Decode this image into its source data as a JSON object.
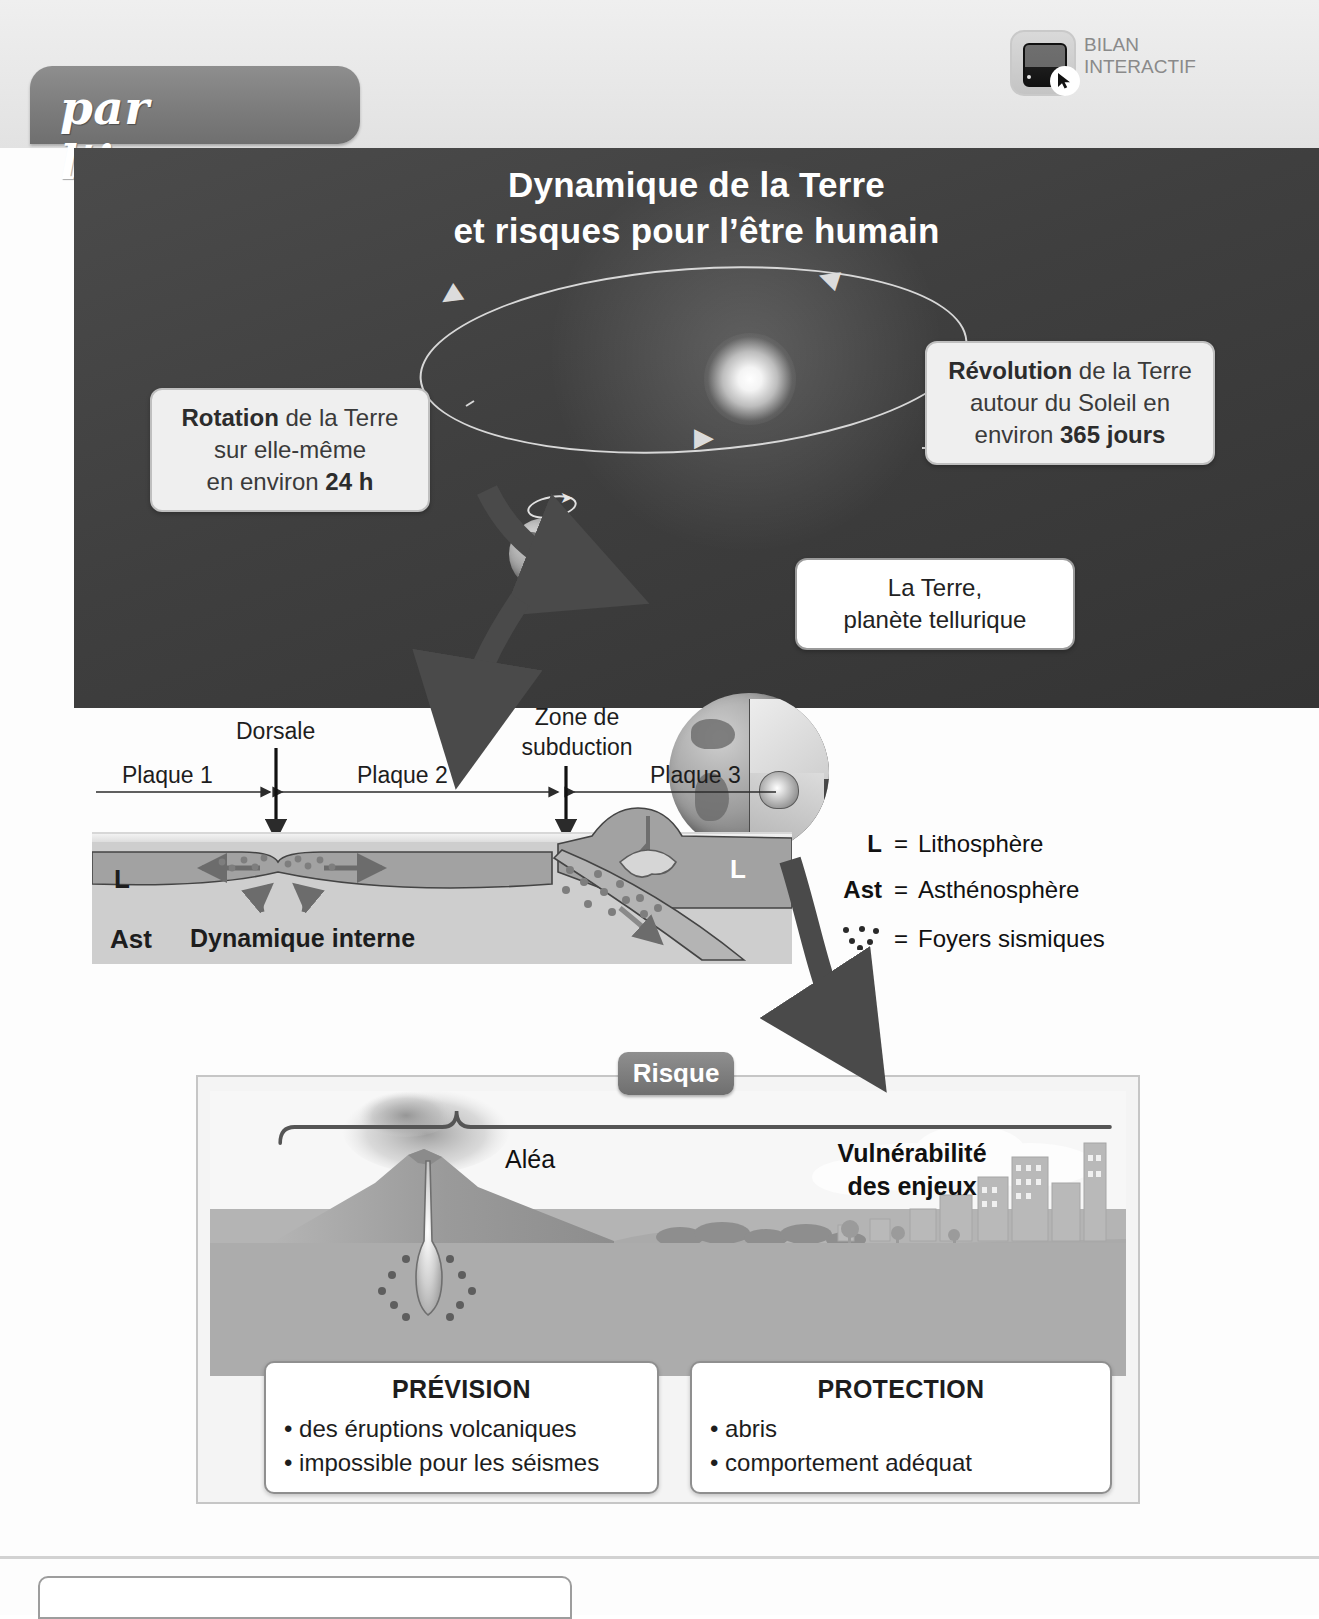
{
  "tab": {
    "label": "par l’image"
  },
  "badge": {
    "icon": "tablet-cursor-icon",
    "line1": "BILAN",
    "line2": "INTERACTIF"
  },
  "hero": {
    "title_line1": "Dynamique de la Terre",
    "title_line2": "et risques pour l’être humain",
    "sun": "sun-glow",
    "earth": "earth-globe",
    "orbit": "orbit-ellipse"
  },
  "callouts": {
    "rotation": {
      "bold1": "Rotation",
      "rest1": " de la Terre",
      "line2": "sur elle-même",
      "line3_pre": "en environ ",
      "line3_bold": "24 h"
    },
    "revolution": {
      "bold1": "Révolution",
      "rest1": " de la Terre",
      "line2": "autour du Soleil en",
      "line3_pre": "environ ",
      "line3_bold": "365 jours"
    },
    "tellurique": {
      "line1": "La Terre,",
      "line2": "planète tellurique"
    }
  },
  "plates": {
    "dorsale": "Dorsale",
    "zone_line1": "Zone de",
    "zone_line2": "subduction",
    "plaque1": "Plaque 1",
    "plaque2": "Plaque 2",
    "plaque3": "Plaque 3",
    "L_left": "L",
    "L_right": "L",
    "Ast": "Ast",
    "dynamique": "Dynamique interne"
  },
  "legend": [
    {
      "key": "L",
      "eq": "=",
      "label": "Lithosphère",
      "icon": "letter-L"
    },
    {
      "key": "Ast",
      "eq": "=",
      "label": "Asthénosphère",
      "icon": "letter-Ast"
    },
    {
      "key": "",
      "eq": "=",
      "label": "Foyers sismiques",
      "icon": "seismic-dots-icon"
    }
  ],
  "risk": {
    "badge": "Risque",
    "alea": "Aléa",
    "vulnerabilite_line1": "Vulnérabilité",
    "vulnerabilite_line2": "des enjeux",
    "scene": {
      "volcano": "volcano-icon",
      "city": "city-skyline-icon",
      "lava": "lava-flow-icon"
    }
  },
  "bottom_boxes": [
    {
      "title": "PRÉVISION",
      "items": [
        "• des éruptions volcaniques",
        "• impossible pour les séismes"
      ]
    },
    {
      "title": "PROTECTION",
      "items": [
        "• abris",
        "• comportement adéquat"
      ]
    }
  ],
  "colors": {
    "hero_bg": "#3f3f3f",
    "tab_grey": "#7c7c7c",
    "callout_grey": "#efefef",
    "badge_grey": "#7f7f7f",
    "plate_fill": "#9d9d9d",
    "asth_fill": "#cfcfcf"
  }
}
